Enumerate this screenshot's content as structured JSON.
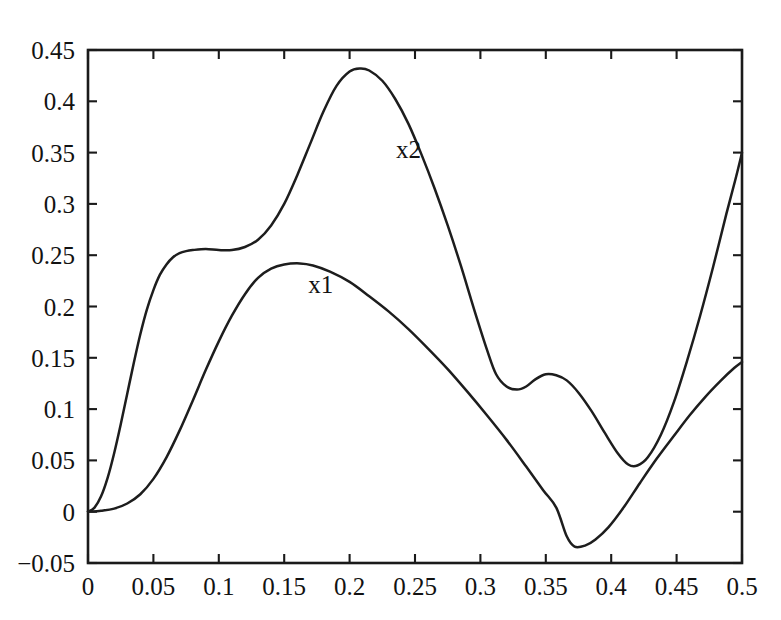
{
  "chart_data": {
    "type": "line",
    "title": "",
    "subtitle": "",
    "xlabel": "",
    "ylabel": "",
    "xlim": [
      0,
      0.5
    ],
    "ylim": [
      -0.05,
      0.45
    ],
    "grid": false,
    "legend_position": "inline-annotation",
    "x_ticks": [
      0,
      0.05,
      0.1,
      0.15,
      0.2,
      0.25,
      0.3,
      0.35,
      0.4,
      0.45,
      0.5
    ],
    "x_tick_labels": [
      "0",
      "0.05",
      "0.1",
      "0.15",
      "0.2",
      "0.25",
      "0.3",
      "0.35",
      "0.4",
      "0.45",
      "0.5"
    ],
    "y_ticks": [
      -0.05,
      0,
      0.05,
      0.1,
      0.15,
      0.2,
      0.25,
      0.3,
      0.35,
      0.4,
      0.45
    ],
    "y_tick_labels": [
      "−0.05",
      "0",
      "0.05",
      "0.1",
      "0.15",
      "0.2",
      "0.25",
      "0.3",
      "0.35",
      "0.4",
      "0.45"
    ],
    "series": [
      {
        "name": "x2",
        "label": "x2",
        "color": "#1d1d1d",
        "label_point": {
          "x": 0.245,
          "y": 0.345
        },
        "points": [
          {
            "x": 0.0,
            "y": 0.0
          },
          {
            "x": 0.005,
            "y": 0.004
          },
          {
            "x": 0.01,
            "y": 0.015
          },
          {
            "x": 0.015,
            "y": 0.033
          },
          {
            "x": 0.02,
            "y": 0.057
          },
          {
            "x": 0.025,
            "y": 0.085
          },
          {
            "x": 0.03,
            "y": 0.115
          },
          {
            "x": 0.035,
            "y": 0.145
          },
          {
            "x": 0.04,
            "y": 0.173
          },
          {
            "x": 0.045,
            "y": 0.197
          },
          {
            "x": 0.05,
            "y": 0.216
          },
          {
            "x": 0.055,
            "y": 0.231
          },
          {
            "x": 0.06,
            "y": 0.241
          },
          {
            "x": 0.065,
            "y": 0.248
          },
          {
            "x": 0.07,
            "y": 0.252
          },
          {
            "x": 0.075,
            "y": 0.254
          },
          {
            "x": 0.08,
            "y": 0.255
          },
          {
            "x": 0.09,
            "y": 0.256
          },
          {
            "x": 0.1,
            "y": 0.255
          },
          {
            "x": 0.11,
            "y": 0.255
          },
          {
            "x": 0.12,
            "y": 0.258
          },
          {
            "x": 0.13,
            "y": 0.265
          },
          {
            "x": 0.14,
            "y": 0.279
          },
          {
            "x": 0.15,
            "y": 0.3
          },
          {
            "x": 0.16,
            "y": 0.328
          },
          {
            "x": 0.17,
            "y": 0.359
          },
          {
            "x": 0.18,
            "y": 0.39
          },
          {
            "x": 0.19,
            "y": 0.415
          },
          {
            "x": 0.2,
            "y": 0.429
          },
          {
            "x": 0.208,
            "y": 0.432
          },
          {
            "x": 0.215,
            "y": 0.43
          },
          {
            "x": 0.225,
            "y": 0.42
          },
          {
            "x": 0.235,
            "y": 0.402
          },
          {
            "x": 0.245,
            "y": 0.378
          },
          {
            "x": 0.255,
            "y": 0.348
          },
          {
            "x": 0.265,
            "y": 0.315
          },
          {
            "x": 0.275,
            "y": 0.279
          },
          {
            "x": 0.285,
            "y": 0.24
          },
          {
            "x": 0.295,
            "y": 0.198
          },
          {
            "x": 0.305,
            "y": 0.158
          },
          {
            "x": 0.312,
            "y": 0.134
          },
          {
            "x": 0.32,
            "y": 0.122
          },
          {
            "x": 0.328,
            "y": 0.119
          },
          {
            "x": 0.335,
            "y": 0.122
          },
          {
            "x": 0.342,
            "y": 0.129
          },
          {
            "x": 0.35,
            "y": 0.134
          },
          {
            "x": 0.358,
            "y": 0.133
          },
          {
            "x": 0.366,
            "y": 0.128
          },
          {
            "x": 0.375,
            "y": 0.116
          },
          {
            "x": 0.385,
            "y": 0.098
          },
          {
            "x": 0.395,
            "y": 0.077
          },
          {
            "x": 0.405,
            "y": 0.057
          },
          {
            "x": 0.413,
            "y": 0.046
          },
          {
            "x": 0.42,
            "y": 0.045
          },
          {
            "x": 0.428,
            "y": 0.053
          },
          {
            "x": 0.438,
            "y": 0.075
          },
          {
            "x": 0.448,
            "y": 0.107
          },
          {
            "x": 0.458,
            "y": 0.147
          },
          {
            "x": 0.468,
            "y": 0.191
          },
          {
            "x": 0.478,
            "y": 0.239
          },
          {
            "x": 0.488,
            "y": 0.29
          },
          {
            "x": 0.495,
            "y": 0.324
          },
          {
            "x": 0.5,
            "y": 0.35
          }
        ]
      },
      {
        "name": "x1",
        "label": "x1",
        "color": "#1d1d1d",
        "label_point": {
          "x": 0.178,
          "y": 0.213
        },
        "points": [
          {
            "x": 0.0,
            "y": 0.0
          },
          {
            "x": 0.01,
            "y": 0.001
          },
          {
            "x": 0.02,
            "y": 0.003
          },
          {
            "x": 0.03,
            "y": 0.008
          },
          {
            "x": 0.04,
            "y": 0.017
          },
          {
            "x": 0.05,
            "y": 0.032
          },
          {
            "x": 0.06,
            "y": 0.053
          },
          {
            "x": 0.07,
            "y": 0.079
          },
          {
            "x": 0.08,
            "y": 0.108
          },
          {
            "x": 0.09,
            "y": 0.138
          },
          {
            "x": 0.1,
            "y": 0.166
          },
          {
            "x": 0.11,
            "y": 0.191
          },
          {
            "x": 0.12,
            "y": 0.212
          },
          {
            "x": 0.13,
            "y": 0.228
          },
          {
            "x": 0.14,
            "y": 0.237
          },
          {
            "x": 0.15,
            "y": 0.241
          },
          {
            "x": 0.162,
            "y": 0.242
          },
          {
            "x": 0.172,
            "y": 0.24
          },
          {
            "x": 0.185,
            "y": 0.234
          },
          {
            "x": 0.2,
            "y": 0.224
          },
          {
            "x": 0.215,
            "y": 0.21
          },
          {
            "x": 0.23,
            "y": 0.195
          },
          {
            "x": 0.245,
            "y": 0.178
          },
          {
            "x": 0.26,
            "y": 0.159
          },
          {
            "x": 0.275,
            "y": 0.139
          },
          {
            "x": 0.29,
            "y": 0.117
          },
          {
            "x": 0.305,
            "y": 0.094
          },
          {
            "x": 0.32,
            "y": 0.07
          },
          {
            "x": 0.335,
            "y": 0.044
          },
          {
            "x": 0.348,
            "y": 0.021
          },
          {
            "x": 0.358,
            "y": 0.004
          },
          {
            "x": 0.366,
            "y": -0.024
          },
          {
            "x": 0.372,
            "y": -0.034
          },
          {
            "x": 0.38,
            "y": -0.033
          },
          {
            "x": 0.388,
            "y": -0.027
          },
          {
            "x": 0.398,
            "y": -0.015
          },
          {
            "x": 0.41,
            "y": 0.005
          },
          {
            "x": 0.422,
            "y": 0.028
          },
          {
            "x": 0.435,
            "y": 0.052
          },
          {
            "x": 0.448,
            "y": 0.074
          },
          {
            "x": 0.46,
            "y": 0.094
          },
          {
            "x": 0.472,
            "y": 0.112
          },
          {
            "x": 0.484,
            "y": 0.128
          },
          {
            "x": 0.494,
            "y": 0.14
          },
          {
            "x": 0.5,
            "y": 0.146
          }
        ]
      }
    ]
  }
}
